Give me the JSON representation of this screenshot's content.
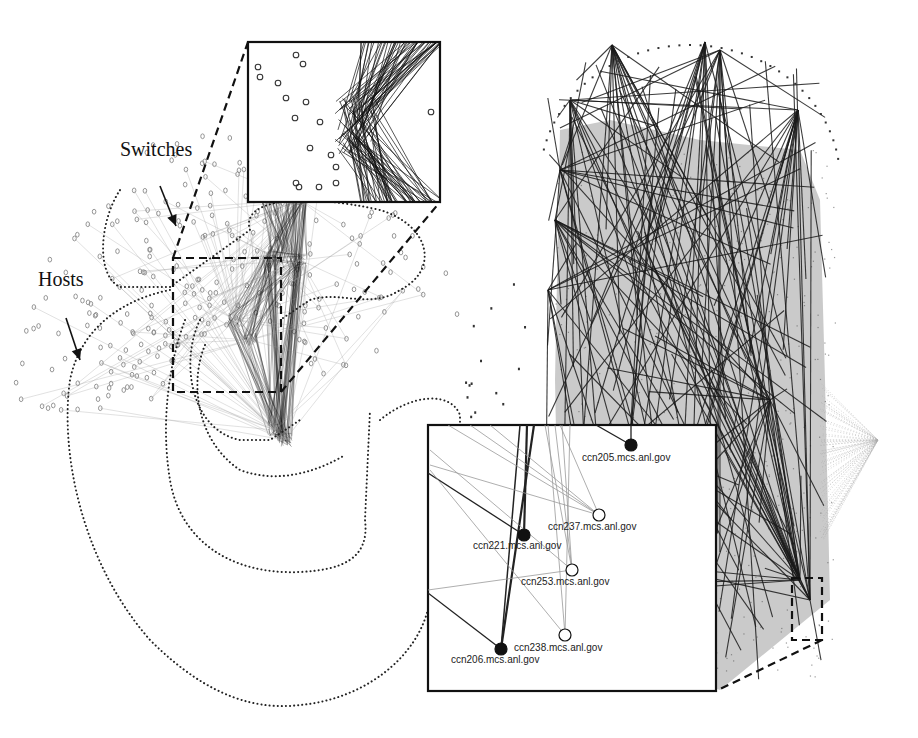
{
  "figure": {
    "width": 918,
    "height": 738,
    "colors": {
      "background": "#ffffff",
      "edge_dark": "#1a1a1a",
      "edge_light": "#9a9a9a",
      "node_light": "#8a8a8a",
      "dense_fill": "#b8b8b8",
      "region_outline": "#222222"
    }
  },
  "annotations": {
    "switches": {
      "label": "Switches",
      "x": 120,
      "y": 158,
      "arrow_from": [
        160,
        186
      ],
      "arrow_to": [
        176,
        226
      ]
    },
    "hosts": {
      "label": "Hosts",
      "x": 38,
      "y": 288,
      "arrow_from": [
        66,
        318
      ],
      "arrow_to": [
        80,
        360
      ]
    }
  },
  "left_graph": {
    "title": "Switch/host topology (left)",
    "zoom_region": {
      "x": 173,
      "y": 258,
      "w": 108,
      "h": 134
    },
    "inset_top": {
      "x": 248,
      "y": 42,
      "w": 192,
      "h": 160
    }
  },
  "right_graph": {
    "title": "Dense network (right)",
    "zoom_region": {
      "x": 792,
      "y": 578,
      "w": 30,
      "h": 62
    },
    "inset_bottom": {
      "x": 428,
      "y": 425,
      "w": 288,
      "h": 266
    }
  },
  "inset_hosts": [
    {
      "name": "ccn205.mcs.anl.gov",
      "x": 631,
      "y": 445,
      "filled": true,
      "lx": 582,
      "ly": 458
    },
    {
      "name": "ccn237.mcs.anl.gov",
      "x": 599,
      "y": 515,
      "filled": false,
      "lx": 548,
      "ly": 527
    },
    {
      "name": "ccn221.mcs.anl.gov",
      "x": 524,
      "y": 535,
      "filled": true,
      "lx": 473,
      "ly": 546
    },
    {
      "name": "ccn253.mcs.anl.gov",
      "x": 572,
      "y": 570,
      "filled": false,
      "lx": 521,
      "ly": 582
    },
    {
      "name": "ccn238.mcs.anl.gov",
      "x": 565,
      "y": 635,
      "filled": false,
      "lx": 514,
      "ly": 648
    },
    {
      "name": "ccn206.mcs.anl.gov",
      "x": 501,
      "y": 649,
      "filled": true,
      "lx": 451,
      "ly": 660
    }
  ]
}
